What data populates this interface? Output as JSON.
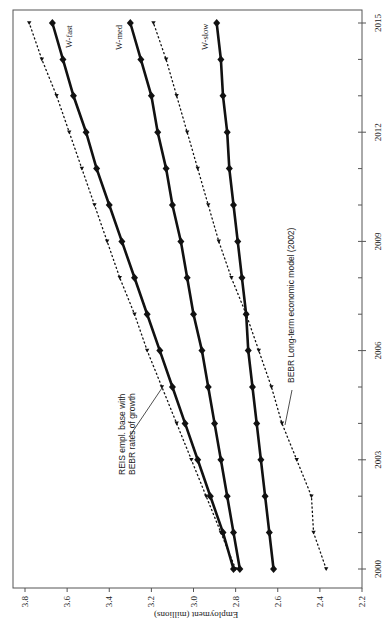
{
  "chart_data": {
    "type": "line",
    "orientation": "rotated 90deg counter-clockwise (x-axis runs bottom-to-top along right edge, y-axis runs along bottom edge reversed)",
    "title": "",
    "xlabel": "",
    "ylabel": "Employment (millions)",
    "x": [
      2000,
      2001,
      2002,
      2003,
      2004,
      2005,
      2006,
      2007,
      2008,
      2009,
      2010,
      2011,
      2012,
      2013,
      2014,
      2015
    ],
    "x_ticks": [
      2000,
      2003,
      2006,
      2009,
      2012,
      2015
    ],
    "y_ticks": [
      2.2,
      2.4,
      2.6,
      2.8,
      3.0,
      3.2,
      3.4,
      3.6,
      3.8
    ],
    "ylim": [
      2.2,
      3.85
    ],
    "xlim": [
      1999.7,
      2015.3
    ],
    "grid": false,
    "series": [
      {
        "name": "W-fast",
        "style": "solid-thick-diamond",
        "values": [
          2.81,
          2.86,
          2.92,
          2.98,
          3.04,
          3.1,
          3.16,
          3.22,
          3.28,
          3.34,
          3.4,
          3.46,
          3.51,
          3.57,
          3.62,
          3.67
        ]
      },
      {
        "name": "W-med",
        "style": "solid-thick-diamond",
        "values": [
          2.78,
          2.81,
          2.84,
          2.87,
          2.9,
          2.93,
          2.96,
          3.0,
          3.03,
          3.06,
          3.1,
          3.13,
          3.17,
          3.2,
          3.25,
          3.3
        ]
      },
      {
        "name": "W-slow",
        "style": "solid-thick-diamond",
        "values": [
          2.62,
          2.64,
          2.66,
          2.68,
          2.7,
          2.72,
          2.74,
          2.75,
          2.77,
          2.79,
          2.81,
          2.83,
          2.84,
          2.86,
          2.87,
          2.89
        ]
      },
      {
        "name": "REIS empl. base with BEBR rates of growth",
        "style": "dotted-triangle",
        "values": [
          2.8,
          2.87,
          2.94,
          3.01,
          3.08,
          3.15,
          3.22,
          3.28,
          3.35,
          3.41,
          3.47,
          3.53,
          3.59,
          3.65,
          3.72,
          3.78
        ]
      },
      {
        "name": "BEBR Long-term economic model (2002)",
        "style": "dotted-triangle",
        "values": [
          2.37,
          2.43,
          2.44,
          2.51,
          2.58,
          2.63,
          2.69,
          2.75,
          2.82,
          2.88,
          2.93,
          2.98,
          3.03,
          3.08,
          3.13,
          3.19
        ]
      }
    ],
    "annotations": [
      {
        "text_lines": [
          "REIS empl. base with",
          "BEBR rates of growth"
        ],
        "points_to": "REIS empl. base with BEBR rates of growth",
        "at_year": 2004.5
      },
      {
        "text_lines": [
          "BEBR Long-term economic model (2002)"
        ],
        "points_to": "BEBR Long-term economic model (2002)",
        "at_year": 2004
      },
      {
        "text_lines": [
          "W-fast"
        ],
        "at_year": 2015
      },
      {
        "text_lines": [
          "W-med"
        ],
        "at_year": 2015
      },
      {
        "text_lines": [
          "W-slow"
        ],
        "at_year": 2015
      }
    ],
    "legend": "none (inline labels)"
  },
  "axis": {
    "y_title": "Employment (millions)",
    "y_tick_labels": [
      "3.8",
      "3.6",
      "3.4",
      "3.2",
      "3.0",
      "2.8",
      "2.6",
      "2.4",
      "2.2"
    ],
    "x_tick_labels": [
      "2000",
      "2003",
      "2006",
      "2009",
      "2012",
      "2015"
    ]
  },
  "labels": {
    "w_fast": "W-fast",
    "w_med": "W-med",
    "w_slow": "W-slow",
    "reis_line1": "REIS empl. base with",
    "reis_line2": "BEBR rates of growth",
    "bebr": "BEBR Long-term economic model (2002)"
  }
}
